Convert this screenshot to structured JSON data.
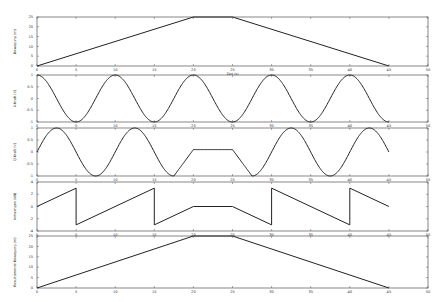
{
  "chart_data": [
    {
      "type": "line",
      "panel": 1,
      "ylabel": "Bewegung (m)",
      "xlabel": "Zeit (s)",
      "xlim": [
        0,
        50
      ],
      "ylim": [
        0,
        25
      ],
      "xticks": [
        0,
        5,
        10,
        15,
        20,
        25,
        30,
        35,
        40,
        45,
        50
      ],
      "yticks": [
        0,
        5,
        10,
        15,
        20,
        25
      ],
      "x": [
        0,
        20,
        25,
        45
      ],
      "y": [
        0,
        25,
        25,
        0
      ]
    },
    {
      "type": "line",
      "panel": 2,
      "ylabel": "X-Kraft (V)",
      "xlim": [
        0,
        50
      ],
      "ylim": [
        -1,
        1
      ],
      "xticks": [
        0,
        5,
        10,
        15,
        20,
        25,
        30,
        35,
        40,
        45,
        50
      ],
      "yticks": [
        -1,
        -0.5,
        0,
        0.5,
        1
      ],
      "function": "cos(2*pi*x/10)",
      "x_range": [
        0,
        45
      ]
    },
    {
      "type": "line",
      "panel": 3,
      "ylabel": "Q-Kraft (V)",
      "xlim": [
        0,
        50
      ],
      "ylim": [
        -1,
        1
      ],
      "xticks": [
        0,
        5,
        10,
        15,
        20,
        25,
        30,
        35,
        40,
        45,
        50
      ],
      "yticks": [
        -1,
        -0.5,
        0,
        0.5,
        1
      ],
      "segments": [
        {
          "x_range": [
            0,
            17.5
          ],
          "function": "sin(2*pi*x/10)"
        },
        {
          "x_range": [
            17.5,
            20
          ],
          "function": "ramp up to plateau"
        },
        {
          "x_range": [
            20,
            25
          ],
          "value": 0.1
        },
        {
          "x_range": [
            25,
            27.5
          ],
          "function": "ramp down to -1"
        },
        {
          "x_range": [
            27.5,
            45
          ],
          "function": "-cos(2*pi*(x-27.5)/10)"
        }
      ]
    },
    {
      "type": "line",
      "panel": 4,
      "ylabel": "Anhaengen (kN)",
      "xlim": [
        0,
        50
      ],
      "ylim": [
        -4,
        4
      ],
      "xticks": [
        0,
        5,
        10,
        15,
        20,
        25,
        30,
        35,
        40,
        45,
        50
      ],
      "yticks": [
        -4,
        -2,
        0,
        2,
        4
      ],
      "x": [
        0,
        5,
        5,
        15,
        15,
        20,
        25,
        30,
        30,
        40,
        40,
        45
      ],
      "y": [
        0,
        3,
        -3,
        3,
        -3,
        0,
        0,
        -3,
        3,
        -3,
        3,
        0
      ]
    },
    {
      "type": "line",
      "panel": 5,
      "ylabel": "Resultierende Bewegung (m)",
      "xlim": [
        0,
        50
      ],
      "ylim": [
        0,
        25
      ],
      "xticks": [
        0,
        5,
        10,
        15,
        20,
        25,
        30,
        35,
        40,
        45,
        50
      ],
      "yticks": [
        0,
        5,
        10,
        15,
        20,
        25
      ],
      "x": [
        0,
        20,
        25,
        45
      ],
      "y": [
        0,
        25,
        25,
        0
      ]
    }
  ],
  "layout": {
    "plot_left": 37,
    "plot_right": 428,
    "panels": [
      {
        "top": 17,
        "bottom": 66
      },
      {
        "top": 75,
        "bottom": 122
      },
      {
        "top": 128,
        "bottom": 176
      },
      {
        "top": 182,
        "bottom": 231
      },
      {
        "top": 236,
        "bottom": 288
      }
    ]
  },
  "colors": {
    "line": "#222222",
    "frame": "#555555",
    "background": "#ffffff"
  }
}
